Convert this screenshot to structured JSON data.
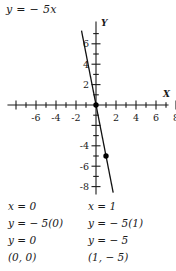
{
  "title_equation": "y = − 5x",
  "chart_data": {
    "type": "line",
    "title": "y = − 5x",
    "equation": "y = -5x",
    "slope": -5,
    "intercept": 0,
    "xlabel": "X",
    "ylabel": "Y",
    "xlim": [
      -8,
      8
    ],
    "ylim": [
      -8.6,
      7.6
    ],
    "grid": false,
    "legend": "none",
    "x_tick_labels": [
      "-6",
      "-4",
      "-2",
      "2",
      "4",
      "6",
      "8"
    ],
    "x_tick_label_values": [
      -6,
      -4,
      -2,
      2,
      4,
      6,
      8
    ],
    "x_tick_values": [
      -8,
      -7,
      -6,
      -5,
      -4,
      -3,
      -2,
      -1,
      1,
      2,
      3,
      4,
      5,
      6,
      7,
      8
    ],
    "y_tick_labels": [
      "6",
      "4",
      "2",
      "-4",
      "-6",
      "-8"
    ],
    "y_tick_label_values": [
      6,
      4,
      2,
      -4,
      -6,
      -8
    ],
    "y_tick_values": [
      7,
      6,
      5,
      4,
      3,
      2,
      1,
      -1,
      -2,
      -3,
      -4,
      -5,
      -6,
      -7,
      -8
    ],
    "points": [
      {
        "label": "(0, 0)",
        "x": 0,
        "y": 0
      },
      {
        "label": "(1, -5)",
        "x": 1,
        "y": -5
      }
    ],
    "line_endpoints": [
      {
        "x": -1.45,
        "y": 7.3
      },
      {
        "x": 1.72,
        "y": -8.6
      }
    ],
    "series": [
      {
        "name": "y = -5x",
        "x": [
          -1.45,
          0,
          1,
          1.72
        ],
        "values": [
          7.25,
          0,
          -5,
          -8.6
        ]
      }
    ]
  },
  "solutions": {
    "left": {
      "lines": [
        "x = 0",
        "y = − 5(0)",
        "y = 0",
        "(0, 0)"
      ]
    },
    "right": {
      "lines": [
        "x = 1",
        "y = − 5(1)",
        "y = − 5",
        "(1, − 5)"
      ]
    }
  },
  "colors": {
    "ink": "#1a1a1a",
    "background": "#ffffff",
    "line": "#111111",
    "point": "#000000"
  }
}
